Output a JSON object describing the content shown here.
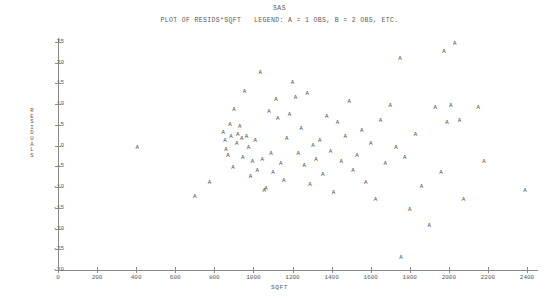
{
  "page": {
    "system_title": "SAS",
    "plot_title": "PLOT OF RESIDS*SQFT   LEGEND: A = 1 OBS, B = 2 OBS, ETC."
  },
  "axes": {
    "ylabel": "RESIDUALS",
    "xlabel": "SQFT",
    "yticks": [
      "25",
      "20",
      "15",
      "10",
      "5",
      "0",
      "-5",
      "-10",
      "-15",
      "-20",
      "-25",
      "-30"
    ],
    "xticks": [
      "0",
      "200",
      "400",
      "600",
      "800",
      "1000",
      "1200",
      "1400",
      "1600",
      "1800",
      "2000",
      "2200",
      "2400"
    ]
  },
  "marker": {
    "glyph": "A",
    "meaning": "1 OBS"
  },
  "chart_data": {
    "type": "scatter",
    "title": "PLOT OF RESIDS*SQFT   LEGEND: A = 1 OBS, B = 2 OBS, ETC.",
    "subtitle": "SAS",
    "xlabel": "SQFT",
    "ylabel": "RESIDUALS",
    "xlim": [
      0,
      2400
    ],
    "ylim": [
      -30,
      25
    ],
    "xtick_step": 200,
    "ytick_step": 5,
    "grid": false,
    "legend": "A = 1 OBS, B = 2 OBS, ETC.",
    "legend_position": "title",
    "marker_symbol": "A",
    "points": [
      {
        "x": 405,
        "y": -0.5
      },
      {
        "x": 700,
        "y": -12.5
      },
      {
        "x": 775,
        "y": -9.0
      },
      {
        "x": 845,
        "y": 3.0
      },
      {
        "x": 855,
        "y": 1.0
      },
      {
        "x": 860,
        "y": -1.0
      },
      {
        "x": 870,
        "y": -2.5
      },
      {
        "x": 880,
        "y": 5.0
      },
      {
        "x": 885,
        "y": 2.0
      },
      {
        "x": 895,
        "y": -5.5
      },
      {
        "x": 900,
        "y": 8.5
      },
      {
        "x": 915,
        "y": 0.5
      },
      {
        "x": 920,
        "y": 2.5
      },
      {
        "x": 930,
        "y": 4.5
      },
      {
        "x": 940,
        "y": 1.5
      },
      {
        "x": 945,
        "y": -3.0
      },
      {
        "x": 955,
        "y": 13.0
      },
      {
        "x": 965,
        "y": 2.0
      },
      {
        "x": 975,
        "y": -0.5
      },
      {
        "x": 985,
        "y": -7.5
      },
      {
        "x": 995,
        "y": -4.0
      },
      {
        "x": 1010,
        "y": 1.0
      },
      {
        "x": 1020,
        "y": -6.0
      },
      {
        "x": 1035,
        "y": 17.5
      },
      {
        "x": 1045,
        "y": -3.5
      },
      {
        "x": 1055,
        "y": -11.0
      },
      {
        "x": 1065,
        "y": -10.5
      },
      {
        "x": 1080,
        "y": 8.0
      },
      {
        "x": 1090,
        "y": -2.0
      },
      {
        "x": 1100,
        "y": -6.5
      },
      {
        "x": 1115,
        "y": 11.0
      },
      {
        "x": 1125,
        "y": 6.5
      },
      {
        "x": 1140,
        "y": -4.5
      },
      {
        "x": 1155,
        "y": -8.5
      },
      {
        "x": 1170,
        "y": 1.5
      },
      {
        "x": 1185,
        "y": 7.5
      },
      {
        "x": 1200,
        "y": 15.0
      },
      {
        "x": 1215,
        "y": 11.5
      },
      {
        "x": 1230,
        "y": -2.0
      },
      {
        "x": 1245,
        "y": 4.0
      },
      {
        "x": 1260,
        "y": -5.0
      },
      {
        "x": 1275,
        "y": 12.5
      },
      {
        "x": 1290,
        "y": -9.5
      },
      {
        "x": 1305,
        "y": 0.0
      },
      {
        "x": 1320,
        "y": -3.5
      },
      {
        "x": 1340,
        "y": 1.0
      },
      {
        "x": 1355,
        "y": -7.0
      },
      {
        "x": 1375,
        "y": 7.0
      },
      {
        "x": 1395,
        "y": -1.5
      },
      {
        "x": 1410,
        "y": -11.5
      },
      {
        "x": 1430,
        "y": 5.5
      },
      {
        "x": 1450,
        "y": -4.0
      },
      {
        "x": 1470,
        "y": 2.0
      },
      {
        "x": 1490,
        "y": 10.5
      },
      {
        "x": 1510,
        "y": -6.0
      },
      {
        "x": 1530,
        "y": -2.5
      },
      {
        "x": 1555,
        "y": 3.5
      },
      {
        "x": 1575,
        "y": -9.0
      },
      {
        "x": 1600,
        "y": 0.5
      },
      {
        "x": 1625,
        "y": -13.0
      },
      {
        "x": 1650,
        "y": 6.0
      },
      {
        "x": 1675,
        "y": -4.5
      },
      {
        "x": 1700,
        "y": 9.5
      },
      {
        "x": 1730,
        "y": -0.5
      },
      {
        "x": 1750,
        "y": 21.0
      },
      {
        "x": 1755,
        "y": -27.0
      },
      {
        "x": 1775,
        "y": -3.0
      },
      {
        "x": 1800,
        "y": -15.5
      },
      {
        "x": 1830,
        "y": 2.5
      },
      {
        "x": 1860,
        "y": -10.0
      },
      {
        "x": 1900,
        "y": -19.5
      },
      {
        "x": 1930,
        "y": 9.0
      },
      {
        "x": 1960,
        "y": -6.5
      },
      {
        "x": 1990,
        "y": 5.5
      },
      {
        "x": 2010,
        "y": 9.5
      },
      {
        "x": 2030,
        "y": 24.5
      },
      {
        "x": 2055,
        "y": 6.0
      },
      {
        "x": 2075,
        "y": -13.0
      },
      {
        "x": 2150,
        "y": 9.0
      },
      {
        "x": 2180,
        "y": -4.0
      },
      {
        "x": 2390,
        "y": -11.0
      },
      {
        "x": 1975,
        "y": 22.5
      }
    ]
  }
}
